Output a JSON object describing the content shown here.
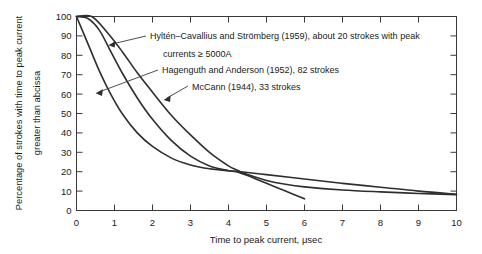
{
  "chart_data": {
    "type": "line",
    "title": "",
    "xlabel": "Time to peak current, μsec",
    "ylabel": "Percentage of strokes with time to peak current greater than abcissa",
    "xlim": [
      0,
      10
    ],
    "ylim": [
      0,
      100
    ],
    "xticks": [
      0,
      1,
      2,
      3,
      4,
      5,
      6,
      7,
      8,
      9,
      10
    ],
    "yticks": [
      0,
      10,
      20,
      30,
      40,
      50,
      60,
      70,
      80,
      90,
      100
    ],
    "grid": false,
    "legend_position": "annotations-inside-plot",
    "series": [
      {
        "name": "Hyltén–Cavallius and Strömberg (1959)",
        "annotation": "Hyltén–Cavallius and Strömberg (1959), about 20 strokes with peak",
        "annotation_line2": "currents ≥ 5000A",
        "strokes": 20,
        "x": [
          0,
          0.4,
          0.8,
          1.2,
          1.6,
          2.0,
          2.5,
          3.0,
          3.5,
          4.0,
          4.2,
          4.5,
          5.0,
          5.5,
          6.0,
          7.0,
          8.0,
          9.0,
          10.0
        ],
        "y": [
          100,
          100,
          92,
          82,
          71,
          61,
          49,
          39,
          30,
          23,
          21,
          18.5,
          15.5,
          13.5,
          12.2,
          10.6,
          9.6,
          8.8,
          8.2
        ]
      },
      {
        "name": "Hagenguth and Anderson (1952)",
        "annotation": "Hagenguth and Anderson (1952), 82 strokes",
        "strokes": 82,
        "x": [
          0,
          0.3,
          0.6,
          0.9,
          1.2,
          1.6,
          2.0,
          2.5,
          3.0,
          3.5,
          4.0,
          4.2,
          4.5,
          5.0,
          5.5,
          6.0
        ],
        "y": [
          100,
          99,
          93,
          82,
          71,
          58,
          47,
          36,
          28,
          23,
          20.5,
          20,
          18,
          14,
          10,
          6
        ]
      },
      {
        "name": "McCann (1944)",
        "annotation": "McCann (1944), 33 strokes",
        "strokes": 33,
        "x": [
          0,
          0.3,
          0.6,
          0.9,
          1.2,
          1.6,
          2.0,
          2.5,
          3.0,
          3.5,
          4.0,
          4.2,
          5.0,
          6.0,
          7.0,
          8.0,
          9.0,
          10.0
        ],
        "y": [
          100,
          86,
          72,
          60,
          50,
          40,
          33,
          27,
          23.5,
          21.5,
          20.5,
          20.2,
          18.5,
          16.2,
          14,
          12,
          10,
          8.4
        ]
      }
    ]
  },
  "axis": {
    "ylabel_line1": "Percentage of strokes with time to peak current",
    "ylabel_line2": "greater than abcissa",
    "xlabel": "Time to peak current, μsec"
  },
  "ticklabels": {
    "y": [
      "0",
      "10",
      "20",
      "30",
      "40",
      "50",
      "60",
      "70",
      "80",
      "90",
      "100"
    ],
    "x": [
      "0",
      "1",
      "2",
      "3",
      "4",
      "5",
      "6",
      "7",
      "8",
      "9",
      "10"
    ]
  },
  "annotations": {
    "hylten_line1": "Hyltén–Cavallius and Strömberg (1959), about 20 strokes with peak",
    "hylten_line2": "currents ≥ 5000A",
    "hagenguth": "Hagenguth and Anderson (1952), 82 strokes",
    "mccann": "McCann (1944), 33 strokes"
  },
  "colors": {
    "curve": "#2e2e2e",
    "axis": "#3a3a3a",
    "text": "#1a1a1a",
    "background": "#ffffff"
  }
}
